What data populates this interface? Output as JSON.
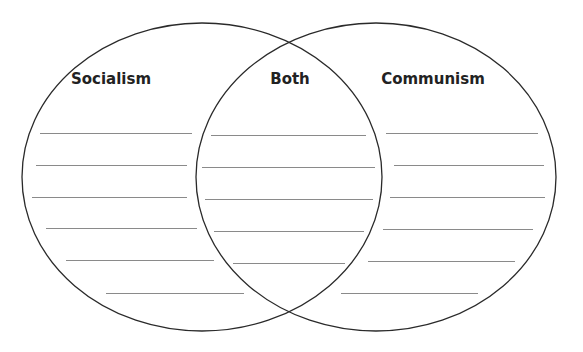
{
  "diagram": {
    "type": "venn",
    "sets": [
      {
        "id": "left",
        "label": "Socialism",
        "label_x": 111
      },
      {
        "id": "center",
        "label": "Both",
        "label_x": 290
      },
      {
        "id": "right",
        "label": "Communism",
        "label_x": 433
      }
    ],
    "ellipses": [
      {
        "cx": 202,
        "cy": 177,
        "rx": 180,
        "ry": 154
      },
      {
        "cx": 376,
        "cy": 177,
        "rx": 180,
        "ry": 154
      }
    ],
    "stroke_color": "#2a2a2a",
    "line_color": "#8a8a8a",
    "writing_lines": {
      "left": [
        [
          133,
          40,
          192
        ],
        [
          165,
          36,
          187
        ],
        [
          197,
          32,
          187
        ],
        [
          228,
          46,
          197
        ],
        [
          260,
          66,
          214
        ],
        [
          293,
          106,
          244
        ]
      ],
      "center": [
        [
          135,
          211,
          366
        ],
        [
          167,
          202,
          375
        ],
        [
          199,
          205,
          373
        ],
        [
          231,
          214,
          364
        ],
        [
          263,
          233,
          345
        ]
      ],
      "right": [
        [
          133,
          386,
          538
        ],
        [
          165,
          394,
          544
        ],
        [
          197,
          390,
          545
        ],
        [
          229,
          383,
          533
        ],
        [
          261,
          368,
          515
        ],
        [
          293,
          341,
          478
        ]
      ]
    }
  }
}
